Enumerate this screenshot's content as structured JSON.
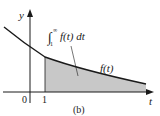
{
  "figure": {
    "caption": "(b)",
    "y_axis_label": "y",
    "x_axis_label": "t",
    "origin_label": "0",
    "tick_label": "1",
    "curve_label": "f(t)",
    "integral_label": {
      "integral_sign": "∫",
      "lower_limit": "1",
      "upper_limit": "∞",
      "integrand": "f(t) dt"
    },
    "colors": {
      "axis": "#1a1a1a",
      "curve": "#1a1a1a",
      "shaded_area": "#c8c8c8"
    }
  }
}
